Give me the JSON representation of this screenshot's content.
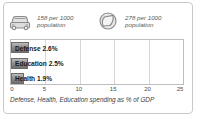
{
  "stats": [
    {
      "icon": "car-icon",
      "value": "158 per 1000",
      "unit": "population"
    },
    {
      "icon": "telephone-icon",
      "value": "278 per 1000",
      "unit": "population"
    }
  ],
  "chart_data": {
    "type": "bar",
    "orientation": "horizontal",
    "categories": [
      "Defense",
      "Education",
      "Health"
    ],
    "values": [
      2.6,
      2.5,
      1.9
    ],
    "data_labels": [
      "Defense 2.6%",
      "Education 2.5%",
      "Health 1.9%"
    ],
    "title": "",
    "xlabel": "Defense, Health, Education spending as % of GDP",
    "ylabel": "",
    "xlim": [
      0,
      25
    ],
    "ticks": [
      "0",
      "5",
      "10",
      "15",
      "20",
      "25"
    ],
    "tick_values": [
      0,
      5,
      10,
      15,
      20,
      25
    ],
    "grid": true,
    "legend": "none",
    "bar_color": "#8f8f8f",
    "grid_color": "#d6d6d6",
    "border_color": "#bdbdbd"
  },
  "caption": "Defense, Health, Education spending as % of GDP"
}
